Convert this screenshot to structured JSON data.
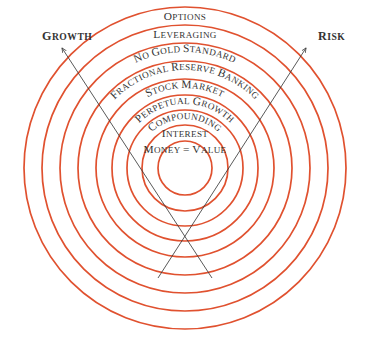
{
  "diagram": {
    "type": "concentric-rings",
    "background_color": "#ffffff",
    "ring_color": "#e0512f",
    "text_color": "#333333",
    "arrow_color": "#3b3b3b",
    "center": {
      "x": 185,
      "y": 168
    },
    "rings": [
      {
        "id": "ring-9",
        "label": "Options",
        "radius": 161,
        "label_radius": 152,
        "curved": false,
        "level": 9
      },
      {
        "id": "ring-8",
        "label": "Leveraging",
        "radius": 143,
        "label_radius": 134,
        "curved": false,
        "level": 8
      },
      {
        "id": "ring-7",
        "label": "No Gold Standard",
        "radius": 125,
        "label_radius": 116,
        "curved": true,
        "level": 7
      },
      {
        "id": "ring-6",
        "label": "Fractional Reserve Banking",
        "radius": 107,
        "label_radius": 98,
        "curved": true,
        "level": 6
      },
      {
        "id": "ring-5",
        "label": "Stock Market",
        "radius": 89,
        "label_radius": 80,
        "curved": true,
        "level": 5
      },
      {
        "id": "ring-4",
        "label": "Perpetual Growth",
        "radius": 73,
        "label_radius": 64,
        "curved": true,
        "level": 4
      },
      {
        "id": "ring-3",
        "label": "Compounding",
        "radius": 58,
        "label_radius": 49,
        "curved": true,
        "level": 3
      },
      {
        "id": "ring-2",
        "label": "Interest",
        "radius": 43,
        "label_radius": 35,
        "curved": false,
        "level": 2
      },
      {
        "id": "ring-1",
        "label": "Money = Value",
        "radius": 27,
        "label_radius": 19,
        "curved": false,
        "level": 1
      }
    ],
    "axes": [
      {
        "id": "axis-growth",
        "label": "Growth",
        "direction": "upper-left",
        "line": {
          "x1": 212,
          "y1": 278,
          "x2": 62,
          "y2": 48
        },
        "label_pos": {
          "x": 42,
          "y": 40
        },
        "anchor": "start"
      },
      {
        "id": "axis-risk",
        "label": "Risk",
        "direction": "upper-right",
        "line": {
          "x1": 158,
          "y1": 278,
          "x2": 306,
          "y2": 48
        },
        "label_pos": {
          "x": 318,
          "y": 40
        },
        "anchor": "start"
      }
    ]
  }
}
